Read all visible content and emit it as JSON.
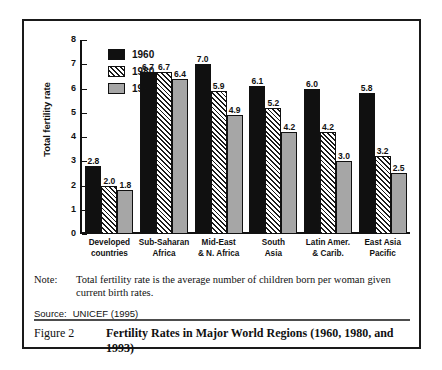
{
  "chart_data": {
    "type": "bar",
    "title": "",
    "xlabel": "",
    "ylabel": "Total fertility rate",
    "ylim": [
      0,
      8
    ],
    "yticks": [
      "0",
      "1",
      "2",
      "3",
      "4",
      "5",
      "6",
      "7",
      "8"
    ],
    "grid": false,
    "legend_position": "top-left",
    "categories": [
      "Developed\ncountries",
      "Sub-Saharan\nAfrica",
      "Mid-East\n& N. Africa",
      "South\nAsia",
      "Latin Amer.\n& Carib.",
      "East Asia\nPacific"
    ],
    "categories_flat": [
      [
        "Developed",
        "countries"
      ],
      [
        "Sub-Saharan",
        "Africa"
      ],
      [
        "Mid-East",
        "& N. Africa"
      ],
      [
        "South",
        "Asia"
      ],
      [
        "Latin Amer.",
        "& Carib."
      ],
      [
        "East Asia",
        "Pacific"
      ]
    ],
    "series": [
      {
        "name": "1960",
        "fill": "solid-black",
        "color": "#101010",
        "values": [
          2.8,
          6.7,
          7.0,
          6.1,
          6.0,
          5.8
        ],
        "labels": [
          "2.8",
          "6.7",
          "7.0",
          "6.1",
          "6.0",
          "5.8"
        ]
      },
      {
        "name": "1980",
        "fill": "diagonal-hatch",
        "color": "#ffffff",
        "values": [
          2.0,
          6.7,
          5.9,
          5.2,
          4.2,
          3.2
        ],
        "labels": [
          "2.0",
          "6.7",
          "5.9",
          "5.2",
          "4.2",
          "3.2"
        ]
      },
      {
        "name": "1993",
        "fill": "solid-gray",
        "color": "#a6a6a6",
        "values": [
          1.8,
          6.4,
          4.9,
          4.2,
          3.0,
          2.5
        ],
        "labels": [
          "1.8",
          "6.4",
          "4.9",
          "4.2",
          "3.0",
          "2.5"
        ]
      }
    ]
  },
  "note": {
    "label": "Note:",
    "text": "Total fertility rate is the average number of children born per woman given current birth rates."
  },
  "source": {
    "label": "Source:",
    "text": "UNICEF (1995)"
  },
  "caption": {
    "number": "Figure 2",
    "title": "Fertility Rates in Major World Regions (1960, 1980, and 1993)"
  }
}
